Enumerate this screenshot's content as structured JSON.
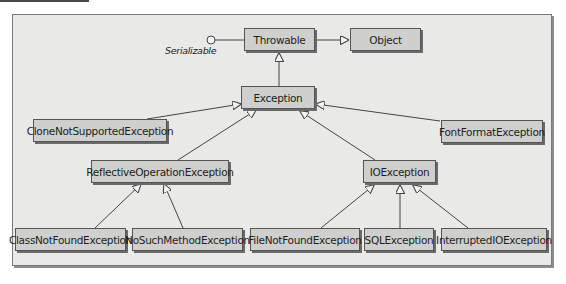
{
  "diagram": {
    "interface_label": "Serializable",
    "nodes": {
      "throwable": "Throwable",
      "object": "Object",
      "exception": "Exception",
      "clone_not_supported": "CloneNotSupportedException",
      "font_format": "FontFormatException",
      "reflective_operation": "ReflectiveOperationException",
      "io_exception": "IOException",
      "class_not_found": "ClassNotFoundException",
      "no_such_method": "NoSuchMethodException",
      "file_not_found": "FileNotFoundException",
      "sql_exception": "SQLException",
      "interrupted_io": "InterruptedIOException"
    },
    "edges": [
      {
        "from": "Throwable",
        "to": "Object",
        "type": "generalization"
      },
      {
        "from": "Throwable",
        "to": "Serializable",
        "type": "realization-lollipop"
      },
      {
        "from": "Exception",
        "to": "Throwable",
        "type": "generalization"
      },
      {
        "from": "CloneNotSupportedException",
        "to": "Exception",
        "type": "generalization"
      },
      {
        "from": "ReflectiveOperationException",
        "to": "Exception",
        "type": "generalization"
      },
      {
        "from": "IOException",
        "to": "Exception",
        "type": "generalization"
      },
      {
        "from": "FontFormatException",
        "to": "Exception",
        "type": "generalization"
      },
      {
        "from": "ClassNotFoundException",
        "to": "ReflectiveOperationException",
        "type": "generalization"
      },
      {
        "from": "NoSuchMethodException",
        "to": "ReflectiveOperationException",
        "type": "generalization"
      },
      {
        "from": "FileNotFoundException",
        "to": "IOException",
        "type": "generalization"
      },
      {
        "from": "SQLException",
        "to": "IOException",
        "type": "generalization"
      },
      {
        "from": "InterruptedIOException",
        "to": "IOException",
        "type": "generalization"
      }
    ]
  },
  "colors": {
    "panel_bg": "#e9e9e7",
    "box_fill": "#cfcfcd",
    "box_border": "#555555",
    "line": "#444444"
  }
}
